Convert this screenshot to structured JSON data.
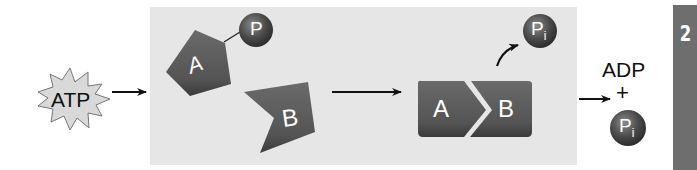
{
  "diagram": {
    "energy_source": {
      "label": "ATP",
      "shape": "starburst"
    },
    "reactants": {
      "molecule_a": {
        "label": "A",
        "attached_group": "P"
      },
      "molecule_b": {
        "label": "B"
      }
    },
    "product": {
      "complex": [
        "A",
        "B"
      ],
      "released_group": {
        "label": "P",
        "subscript": "i"
      }
    },
    "byproducts": {
      "adp_label": "ADP",
      "plus": "+",
      "phosphate": {
        "label": "P",
        "subscript": "i"
      }
    },
    "step_number": "2",
    "colors": {
      "panel": "#e6e6e6",
      "molecule": "#555555",
      "sidebar": "#6e6e6e",
      "starburst": "#d9d9d9"
    }
  }
}
